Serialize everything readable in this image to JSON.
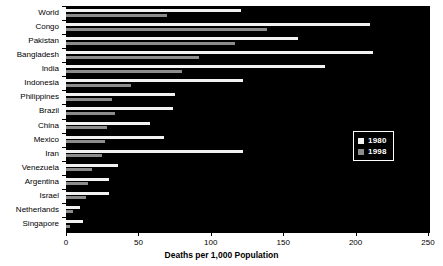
{
  "chart_data": {
    "type": "bar",
    "orientation": "horizontal",
    "title": "",
    "xlabel": "Deaths per 1,000 Population",
    "ylabel": "",
    "xlim": [
      0,
      250
    ],
    "xticks": [
      0,
      50,
      100,
      150,
      200,
      250
    ],
    "grid": false,
    "legend_position": "center-right",
    "categories": [
      "World",
      "Congo",
      "Pakistan",
      "Bangladesh",
      "India",
      "Indonesia",
      "Philippines",
      "Brazil",
      "China",
      "Mexico",
      "Iran",
      "Venezuela",
      "Argentina",
      "Israel",
      "Netherlands",
      "Singapore"
    ],
    "series": [
      {
        "name": "1980",
        "color": "#f2f2f2",
        "values": [
          121,
          210,
          160,
          212,
          179,
          122,
          75,
          74,
          58,
          68,
          122,
          36,
          30,
          30,
          10,
          12
        ]
      },
      {
        "name": "1998",
        "color": "#8c8c8c",
        "values": [
          70,
          139,
          117,
          92,
          80,
          45,
          32,
          34,
          28,
          27,
          25,
          18,
          15,
          14,
          5,
          3
        ]
      }
    ]
  },
  "legend": {
    "items": [
      {
        "label": "1980",
        "color": "#f2f2f2"
      },
      {
        "label": "1998",
        "color": "#8c8c8c"
      }
    ]
  },
  "axis": {
    "x_title": "Deaths per 1,000 Population",
    "x_tick_labels": [
      "0",
      "50",
      "100",
      "150",
      "200",
      "250"
    ]
  },
  "colors": {
    "plot_background": "#000000",
    "page_background": "#ffffff",
    "series_1980": "#f2f2f2",
    "series_1998": "#8c8c8c",
    "text": "#000000",
    "legend_text": "#ffffff"
  }
}
